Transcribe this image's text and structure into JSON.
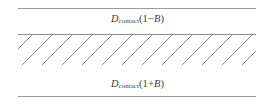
{
  "figure": {
    "name": "contact-distance-band-diagram",
    "background_color": "#ffffff",
    "line_color": "#9a9a9a",
    "text_color": "#3a3a3a",
    "hatch_color": "#8c8c8c"
  },
  "labels": {
    "upper": {
      "symbol": "D",
      "subscript": "contact",
      "open_paren": "(",
      "number_one": "1",
      "operator": "−",
      "variable": "B",
      "close_paren": ")",
      "full_text": "D_contact(1−B)"
    },
    "lower": {
      "symbol": "D",
      "subscript": "contact",
      "open_paren": "(",
      "number_one": "1",
      "operator": "+",
      "variable": "B",
      "close_paren": ")",
      "full_text": "D_contact(1+B)"
    }
  },
  "rules": [
    {
      "id": "upper-bound-line",
      "y": 8
    },
    {
      "id": "middle-line",
      "y": 34
    },
    {
      "id": "lower-bound-line",
      "y": 96
    }
  ],
  "hatching": {
    "angle_degrees": -45,
    "spacing_px": 20,
    "stroke_width": 1,
    "color": "#8c8c8c"
  }
}
